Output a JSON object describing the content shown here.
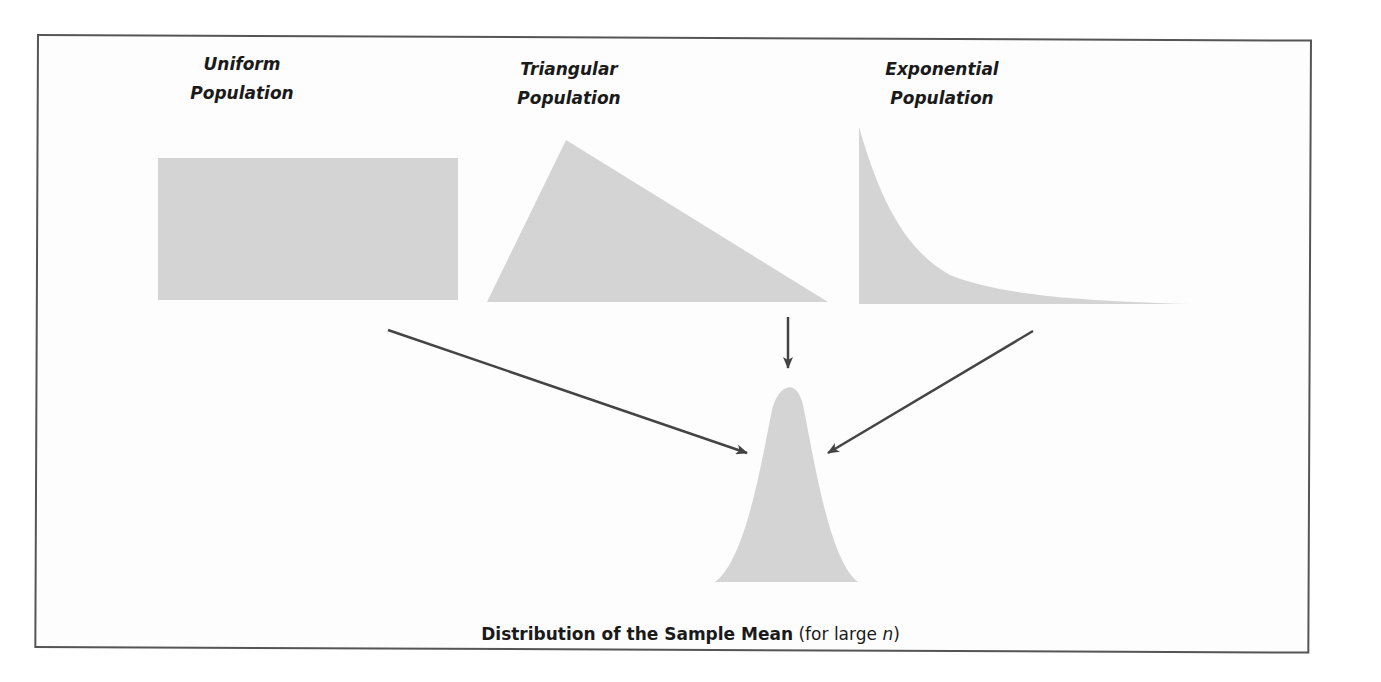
{
  "populations": [
    {
      "id": "uniform",
      "line1": "Uniform",
      "line2": "Population",
      "shape": "rectangle"
    },
    {
      "id": "triangular",
      "line1": "Triangular",
      "line2": "Population",
      "shape": "right-skewed triangle"
    },
    {
      "id": "exponential",
      "line1": "Exponential",
      "line2": "Population",
      "shape": "exponential decay curve"
    }
  ],
  "result": {
    "shape": "normal bell curve",
    "caption_bold": "Distribution of the Sample Mean",
    "caption_paren_open": " (for large ",
    "caption_italic": "n",
    "caption_paren_close": ")"
  },
  "colors": {
    "fill": "#d4d4d4",
    "arrow": "#444444",
    "border": "#555555"
  }
}
